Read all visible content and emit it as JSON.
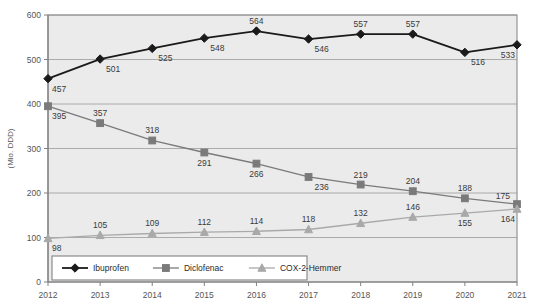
{
  "chart_data": {
    "type": "line",
    "title": "",
    "xlabel": "",
    "ylabel": "(Mio. DDD)",
    "categories": [
      "2012",
      "2013",
      "2014",
      "2015",
      "2016",
      "2017",
      "2018",
      "2019",
      "2020",
      "2021"
    ],
    "x_tick_labels": [
      "2012",
      "2013",
      "2014",
      "2015",
      "2016",
      "2017",
      "2018",
      "2019",
      "2020",
      "2021"
    ],
    "y_tick_labels": [
      "0",
      "100",
      "200",
      "300",
      "400",
      "500",
      "600"
    ],
    "y_ticks": [
      0,
      100,
      200,
      300,
      400,
      500,
      600
    ],
    "ylim": [
      0,
      600
    ],
    "grid": "horizontal",
    "legend_position": "bottom-left-inside",
    "series": [
      {
        "name": "Ibuprofen",
        "marker": "diamond",
        "color": "#1a1a1a",
        "values": [
          457,
          501,
          525,
          548,
          564,
          546,
          557,
          557,
          516,
          533
        ],
        "labels": [
          "457",
          "501",
          "525",
          "548",
          "564",
          "546",
          "557",
          "557",
          "516",
          "533"
        ]
      },
      {
        "name": "Diclofenac",
        "marker": "square",
        "color": "#7a7a7a",
        "values": [
          395,
          357,
          318,
          291,
          266,
          236,
          219,
          204,
          188,
          175
        ],
        "labels": [
          "395",
          "357",
          "318",
          "291",
          "266",
          "236",
          "219",
          "204",
          "188",
          "175"
        ]
      },
      {
        "name": "COX-2-Hemmer",
        "marker": "triangle",
        "color": "#a9a9a9",
        "values": [
          98,
          105,
          109,
          112,
          114,
          118,
          132,
          146,
          155,
          164
        ],
        "labels": [
          "98",
          "105",
          "109",
          "112",
          "114",
          "118",
          "132",
          "146",
          "155",
          "164"
        ]
      }
    ],
    "legend": [
      {
        "label": "Ibuprofen",
        "marker": "diamond",
        "color": "#1a1a1a"
      },
      {
        "label": "Diclofenac",
        "marker": "square",
        "color": "#7a7a7a"
      },
      {
        "label": "COX-2-Hemmer",
        "marker": "triangle",
        "color": "#a9a9a9"
      }
    ],
    "style": {
      "plot_background": "#ebebeb",
      "grid_color": "#9a9a9a",
      "axis_color": "#808080",
      "legend_background": "#ffffff",
      "legend_border": "#8c8c8c",
      "page_background": "#ffffff"
    }
  }
}
